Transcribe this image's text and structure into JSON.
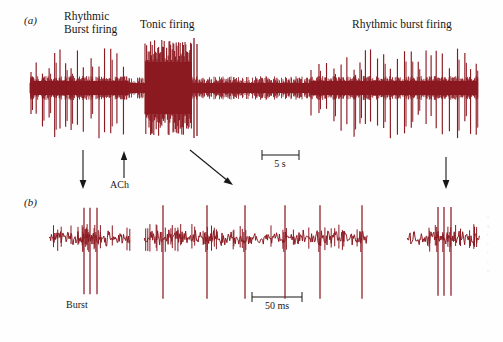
{
  "figure": {
    "background": "#fefefe",
    "trace_color": "#8c1a22",
    "ink_color": "#191716"
  },
  "panels": [
    {
      "letter": "(a)",
      "letter_pos": {
        "x": 24,
        "y": 14
      },
      "labels": [
        {
          "name": "rhythmic-burst-firing-label-a",
          "text": "Rhythmic\nBurst firing",
          "x": 64,
          "y": 12
        },
        {
          "name": "tonic-firing-label",
          "text": "Tonic firing",
          "x": 140,
          "y": 19
        },
        {
          "name": "rhythmic-burst-firing-label-b",
          "text": "Rhythmic burst firing",
          "x": 352,
          "y": 19
        }
      ],
      "annotations": [
        {
          "name": "burst-down-arrow-left",
          "type": "arrow-down",
          "x": 83,
          "y1": 150,
          "y2": 188
        },
        {
          "name": "ach-up-arrow",
          "type": "arrow-up",
          "x": 124,
          "y1": 178,
          "y2": 152
        },
        {
          "name": "ach-label",
          "type": "text",
          "text": "ACh",
          "x": 110,
          "y": 180
        },
        {
          "name": "tonic-diagonal-arrow",
          "type": "arrow-diag",
          "x1": 190,
          "y1": 150,
          "x2": 232,
          "y2": 184
        },
        {
          "name": "burst-down-arrow-right",
          "type": "arrow-down",
          "x": 446,
          "y1": 157,
          "y2": 189
        }
      ],
      "scale_bar": {
        "name": "scale-bar-5s",
        "label": "5 s",
        "x1": 262,
        "x2": 299,
        "y": 155,
        "label_x": 280,
        "label_y": 159
      }
    },
    {
      "letter": "(b)",
      "letter_pos": {
        "x": 24,
        "y": 196
      },
      "labels": [
        {
          "name": "burst-label",
          "text": "Burst",
          "x": 66,
          "y": 300
        }
      ],
      "scale_bar": {
        "name": "scale-bar-50ms",
        "label": "50 ms",
        "x1": 252,
        "x2": 302,
        "y": 297,
        "label_x": 277,
        "label_y": 301
      }
    }
  ],
  "chart_data": {
    "type": "line",
    "xlabel": "",
    "ylabel": "",
    "grid": false,
    "legend_position": "none",
    "traces": [
      {
        "name": "panel-a-trace",
        "panel": "(a)",
        "description": "Continuous extracellular spike train: rhythmic burst firing, switching to tonic firing after ACh application, then recovery of rhythmic burst firing",
        "x_range_px": [
          30,
          478
        ],
        "baseline_y_px": 88,
        "time_scale": {
          "value": 5,
          "unit": "s",
          "bar_px": 37
        },
        "segments": [
          {
            "label": "Rhythmic burst firing",
            "x_start": 30,
            "x_end": 128,
            "mode": "burst",
            "amplitude": 50,
            "density": 0.55
          },
          {
            "label": "transition",
            "x_start": 128,
            "x_end": 145,
            "mode": "low",
            "amplitude": 14,
            "density": 0.4
          },
          {
            "label": "Tonic firing",
            "x_start": 145,
            "x_end": 192,
            "mode": "tonic-block",
            "amplitude": 50,
            "density": 1.0
          },
          {
            "label": "post-tonic quiet",
            "x_start": 192,
            "x_end": 310,
            "mode": "low",
            "amplitude": 16,
            "density": 0.8
          },
          {
            "label": "Rhythmic burst firing recovery",
            "x_start": 310,
            "x_end": 478,
            "mode": "burst",
            "amplitude": 52,
            "density": 0.62
          }
        ]
      },
      {
        "name": "panel-b-trace-left",
        "panel": "(b)",
        "description": "Expanded single burst showing three high-amplitude spikes on noisy baseline",
        "x_range_px": [
          50,
          130
        ],
        "baseline_y_px": 238,
        "spikes_px": [
          84,
          90,
          97
        ],
        "spike_amplitude_px": 72
      },
      {
        "name": "panel-b-trace-middle",
        "panel": "(b)",
        "description": "Expanded tonic firing showing regularly spaced isolated spikes",
        "x_range_px": [
          145,
          368
        ],
        "baseline_y_px": 238,
        "spikes_px": [
          163,
          207,
          245,
          285,
          320,
          362
        ],
        "spike_amplitude_px": 78,
        "time_scale": {
          "value": 50,
          "unit": "ms",
          "bar_px": 50
        }
      },
      {
        "name": "panel-b-trace-right",
        "panel": "(b)",
        "description": "Expanded recovered burst showing three high-amplitude spikes",
        "x_range_px": [
          408,
          480
        ],
        "baseline_y_px": 238,
        "spikes_px": [
          438,
          444,
          451
        ],
        "spike_amplitude_px": 74
      }
    ]
  }
}
